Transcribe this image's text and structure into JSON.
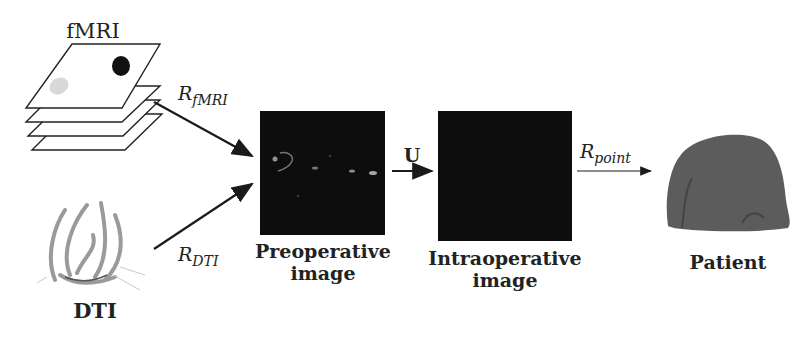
{
  "diagram": {
    "nodes": {
      "fmri": {
        "label": "fMRI"
      },
      "dti": {
        "label": "DTI"
      },
      "preoperative": {
        "label_line1": "Preoperative",
        "label_line2": "image"
      },
      "intraoperative": {
        "label_line1": "Intraoperative",
        "label_line2": "image"
      },
      "patient": {
        "label": "Patient"
      }
    },
    "edges": {
      "r_fmri": {
        "base": "R",
        "sub": "fMRI",
        "from": "fMRI",
        "to": "Preoperative image"
      },
      "r_dti": {
        "base": "R",
        "sub": "DTI",
        "from": "DTI",
        "to": "Preoperative image"
      },
      "u": {
        "label": "U",
        "from": "Preoperative image",
        "to": "Intraoperative image"
      },
      "r_point": {
        "base": "R",
        "sub": "point",
        "from": "Intraoperative image",
        "to": "Patient"
      }
    },
    "colors": {
      "background": "#ffffff",
      "arrow": "#1a1a1a",
      "scan": "#0d0d0d",
      "head": "#555555",
      "dti_fibers": "#9a9a9a"
    }
  }
}
